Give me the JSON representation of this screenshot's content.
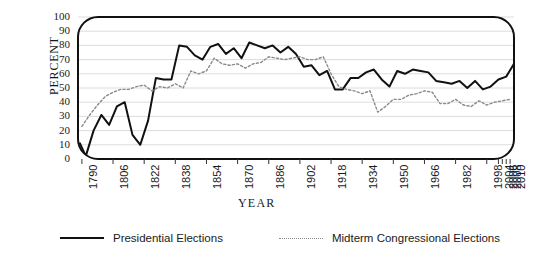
{
  "chart_data": {
    "type": "line",
    "title": "",
    "xlabel": "YEAR",
    "ylabel": "PERCENT",
    "ylim": [
      0,
      100
    ],
    "xlim": [
      1788,
      2012
    ],
    "ytick_values": [
      0,
      10,
      20,
      30,
      40,
      50,
      60,
      70,
      80,
      90,
      100
    ],
    "ytick_labels": [
      "0",
      "10",
      "20",
      "30",
      "40",
      "50",
      "60",
      "70",
      "80",
      "90",
      "100"
    ],
    "xtick_labels": [
      "1790",
      "1806",
      "1822",
      "1838",
      "1854",
      "1870",
      "1886",
      "1902",
      "1918",
      "1934",
      "1950",
      "1966",
      "1982",
      "1998",
      "2004",
      "2006",
      "2008",
      "2010"
    ],
    "xtick_values": [
      1790,
      1806,
      1822,
      1838,
      1854,
      1870,
      1886,
      1902,
      1918,
      1934,
      1950,
      1966,
      1982,
      1998,
      2004,
      2006,
      2008,
      2010
    ],
    "grid": "horizontal",
    "legend_position": "bottom-center",
    "series": [
      {
        "name": "Presidential Elections",
        "style": "solid",
        "color": "#111111",
        "x": [
          1789,
          1792,
          1796,
          1800,
          1804,
          1808,
          1812,
          1816,
          1820,
          1824,
          1828,
          1832,
          1836,
          1840,
          1844,
          1848,
          1852,
          1856,
          1860,
          1864,
          1868,
          1872,
          1876,
          1880,
          1884,
          1888,
          1892,
          1896,
          1900,
          1904,
          1908,
          1912,
          1916,
          1920,
          1924,
          1928,
          1932,
          1936,
          1940,
          1944,
          1948,
          1952,
          1956,
          1960,
          1964,
          1968,
          1972,
          1976,
          1980,
          1984,
          1988,
          1992,
          1996,
          2000,
          2004,
          2008,
          2012
        ],
        "y": [
          11,
          2,
          20,
          31,
          24,
          37,
          40,
          17,
          10,
          27,
          57,
          56,
          56,
          80,
          79,
          73,
          70,
          79,
          81,
          74,
          78,
          71,
          82,
          80,
          78,
          80,
          75,
          79,
          74,
          65,
          66,
          59,
          62,
          49,
          49,
          57,
          57,
          61,
          63,
          56,
          51,
          62,
          60,
          63,
          62,
          61,
          55,
          54,
          53,
          55,
          50,
          55,
          49,
          51,
          56,
          58,
          67
        ],
        "end_value": 67
      },
      {
        "name": "Midterm Congressional Elections",
        "style": "dotted",
        "color": "#8a8a8a",
        "x": [
          1790,
          1794,
          1798,
          1802,
          1806,
          1810,
          1814,
          1818,
          1822,
          1826,
          1830,
          1834,
          1838,
          1842,
          1846,
          1850,
          1854,
          1858,
          1862,
          1866,
          1870,
          1874,
          1878,
          1882,
          1886,
          1890,
          1894,
          1898,
          1902,
          1906,
          1910,
          1914,
          1918,
          1922,
          1926,
          1930,
          1934,
          1938,
          1942,
          1946,
          1950,
          1954,
          1958,
          1962,
          1966,
          1970,
          1974,
          1978,
          1982,
          1986,
          1990,
          1994,
          1998,
          2002,
          2006,
          2010
        ],
        "y": [
          23,
          31,
          38,
          44,
          47,
          49,
          49,
          51,
          52,
          48,
          51,
          50,
          53,
          50,
          62,
          60,
          62,
          71,
          67,
          66,
          67,
          64,
          67,
          68,
          72,
          71,
          70,
          71,
          72,
          70,
          70,
          72,
          60,
          51,
          49,
          48,
          46,
          48,
          33,
          37,
          42,
          42,
          45,
          46,
          48,
          47,
          39,
          39,
          42,
          38,
          37,
          41,
          38,
          40,
          41,
          42
        ],
        "end_value": 47
      }
    ]
  },
  "axes": {
    "y_title": "PERCENT",
    "x_title": "YEAR"
  },
  "legend": {
    "entries": [
      {
        "label": "Presidential Elections",
        "style": "solid"
      },
      {
        "label": "Midterm Congressional Elections",
        "style": "dotted"
      }
    ]
  }
}
